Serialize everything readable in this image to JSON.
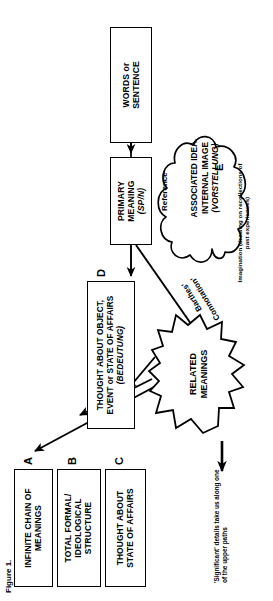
{
  "figure": {
    "label": "Figure 1."
  },
  "boxes": {
    "a": {
      "tag": "A",
      "lines": [
        "INFINITE CHAIN OF",
        "MEANINGS"
      ]
    },
    "b": {
      "tag": "B",
      "lines": [
        "TOTAL FORMAL/",
        "IDEOLOGICAL",
        "STRUCTURE"
      ]
    },
    "c": {
      "tag": "C",
      "lines": [
        "THOUGHT ABOUT",
        "STATE OF AFFAIRS"
      ]
    },
    "d": {
      "tag": "D",
      "lines": [
        "THOUGHT ABOUT OBJECT,",
        "EVENT or STATE OF AFFAIRS"
      ],
      "italic": "(BEDEUTUNG)"
    },
    "words": {
      "lines": [
        "WORDS or",
        "SENTENCE"
      ]
    },
    "primary": {
      "lines": [
        "PRIMARY",
        "MEANING"
      ],
      "italic": "(SP/N)"
    }
  },
  "burst": {
    "lines": [
      "RELATED",
      "MEANINGS"
    ]
  },
  "cloud": {
    "tag": "E",
    "lines": [
      "ASSOCIATED IDEA,",
      "INTERNAL IMAGE"
    ],
    "italic": "(VORSTELLUNG)"
  },
  "annotations": {
    "significant": "'Significant' details take us along one of the upper paths",
    "barthes": "Barthes'",
    "connotation": "Connotation'",
    "reference": "Reference",
    "imagination": "Imagination (drawing on recollections of past experiences)"
  },
  "colors": {
    "ink": "#000000",
    "paper": "#ffffff"
  }
}
